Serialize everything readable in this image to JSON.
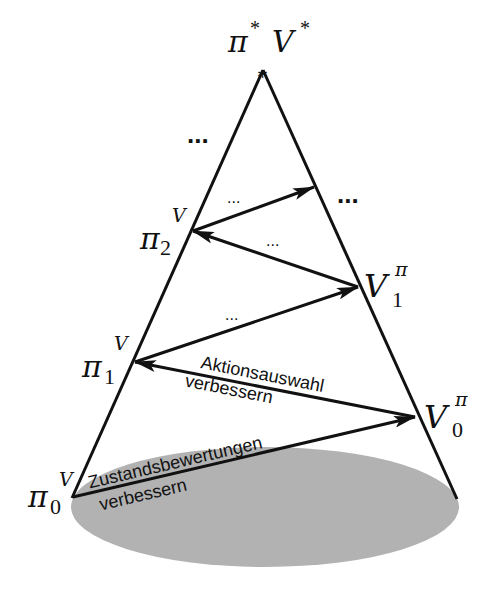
{
  "diagram": {
    "type": "generalized-policy-iteration-cone",
    "colors": {
      "line": "#111111",
      "ellipse_fill": "#b2b2b2",
      "background": "#ffffff"
    },
    "apex": {
      "policy_label": "π",
      "policy_sup": "*",
      "value_label": "V",
      "value_sup": "*",
      "marker": "*"
    },
    "left_nodes": [
      {
        "id": "pi0",
        "base": "π",
        "sub": "0",
        "sup": "V"
      },
      {
        "id": "pi1",
        "base": "π",
        "sub": "1",
        "sup": "V"
      },
      {
        "id": "pi2",
        "base": "π",
        "sub": "2",
        "sup": "V"
      }
    ],
    "right_nodes": [
      {
        "id": "V0",
        "base": "V",
        "sub": "0",
        "sup": "π"
      },
      {
        "id": "V1",
        "base": "V",
        "sub": "1",
        "sup": "π"
      }
    ],
    "edge_labels": {
      "evaluation_line1": "Zustandsbewertungen",
      "evaluation_line2": "verbessern",
      "improvement_line1": "Aktionsauswahl",
      "improvement_line2": "verbessern"
    },
    "ellipsis": {
      "small": "...",
      "large": "..."
    }
  }
}
